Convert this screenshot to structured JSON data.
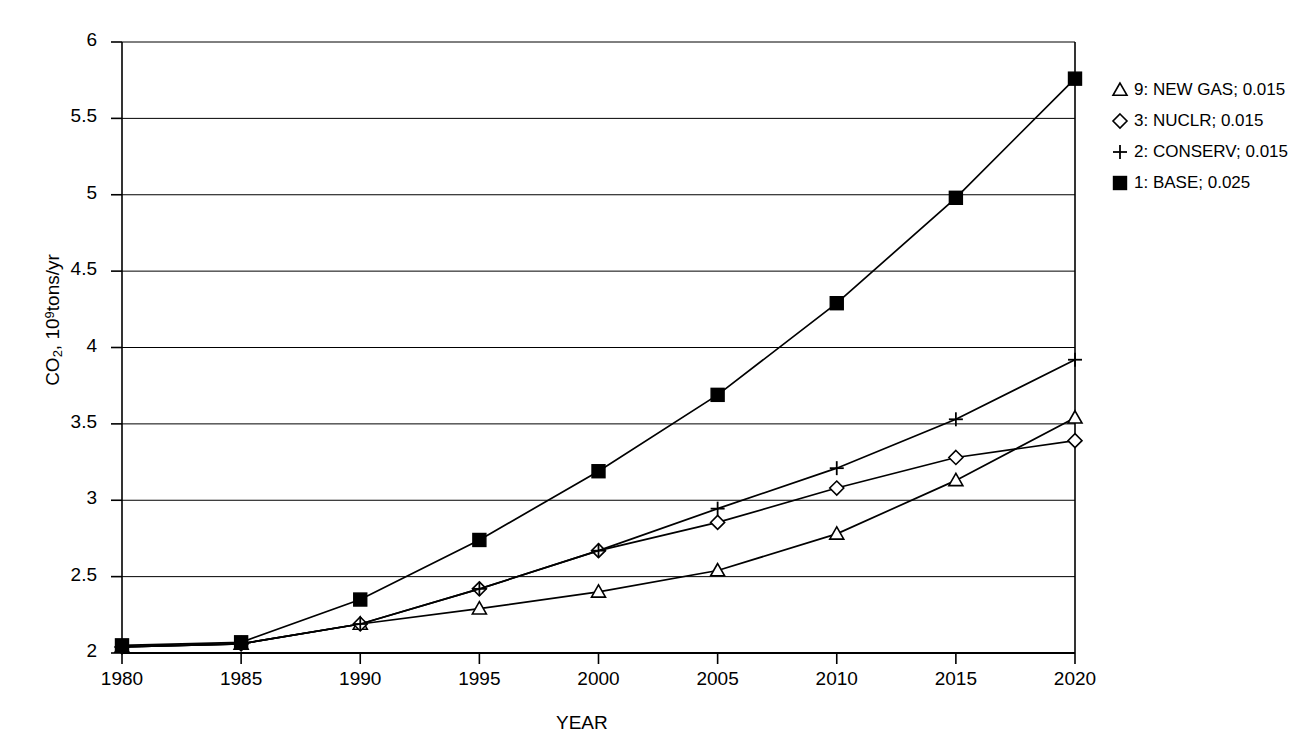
{
  "chart_data": {
    "type": "line",
    "title": "",
    "xlabel": "YEAR",
    "ylabel": "CO2, 10^9 tons/yr",
    "ylabel_parts": {
      "pre": "CO",
      "sub": "2",
      "mid": ", 10",
      "sup": "9",
      "post": "tons/yr"
    },
    "x": [
      1980,
      1985,
      1990,
      1995,
      2000,
      2005,
      2010,
      2015,
      2020
    ],
    "xticks": [
      "1980",
      "1985",
      "1990",
      "1995",
      "2000",
      "2005",
      "2010",
      "2015",
      "2020"
    ],
    "yticks": [
      "2",
      "2.5",
      "3",
      "3.5",
      "4",
      "4.5",
      "5",
      "5.5",
      "6"
    ],
    "xlim": [
      1980,
      2020
    ],
    "ylim": [
      2,
      6
    ],
    "grid": true,
    "legend_position": "right",
    "series": [
      {
        "name": "9: NEW GAS; 0.015",
        "label": "9: NEW GAS; 0.015",
        "marker": "triangle",
        "color": "#000000",
        "values": [
          2.04,
          2.06,
          2.19,
          2.29,
          2.4,
          2.54,
          2.78,
          3.13,
          3.54
        ]
      },
      {
        "name": "3: NUCLR; 0.015",
        "label": "3: NUCLR; 0.015",
        "marker": "diamond",
        "color": "#000000",
        "values": [
          2.04,
          2.06,
          2.19,
          2.42,
          2.67,
          2.855,
          3.08,
          3.28,
          3.39
        ]
      },
      {
        "name": "2: CONSERV; 0.015",
        "label": "2: CONSERV; 0.015",
        "marker": "plus",
        "color": "#000000",
        "values": [
          2.04,
          2.06,
          2.19,
          2.42,
          2.67,
          2.945,
          3.21,
          3.53,
          3.92
        ]
      },
      {
        "name": "1: BASE; 0.025",
        "label": "1: BASE; 0.025",
        "marker": "square",
        "color": "#000000",
        "values": [
          2.05,
          2.07,
          2.35,
          2.74,
          3.19,
          3.69,
          4.29,
          4.98,
          5.76
        ]
      }
    ]
  }
}
